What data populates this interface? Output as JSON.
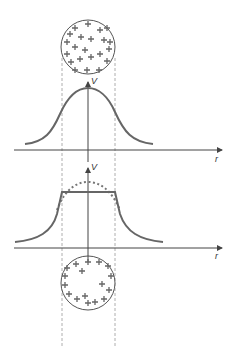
{
  "diagram": {
    "title": "",
    "colors": {
      "curve": "#666666",
      "axis": "#555555",
      "dashed_guide": "#999999",
      "circle_stroke": "#555555",
      "charge": "#666666"
    },
    "top_panel": {
      "sphere": {
        "label": "uniformly charged sphere",
        "charge_symbol": "+",
        "distribution": "volume"
      },
      "axis_labels": {
        "vertical": "V",
        "horizontal": "r"
      },
      "curve": "bell-shaped potential"
    },
    "bottom_panel": {
      "sphere": {
        "label": "conducting sphere",
        "charge_symbol": "+",
        "distribution": "surface"
      },
      "axis_labels": {
        "vertical": "V",
        "horizontal": "r"
      },
      "curve": "flat plateau inside sphere, decaying outside",
      "comparison_curve": "dotted bell-shaped potential"
    }
  }
}
